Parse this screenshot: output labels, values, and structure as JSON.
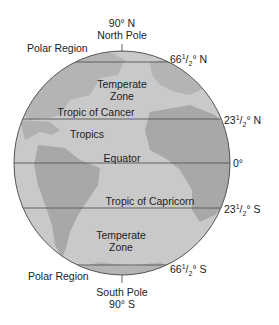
{
  "diagram": {
    "colors": {
      "ocean": "#c9c9c9",
      "land": "#a9a9a9",
      "outline": "#555555",
      "text": "#222222"
    },
    "top": {
      "latitude": "90° N",
      "pole": "North Pole"
    },
    "bottom": {
      "pole": "South Pole",
      "latitude": "90° S"
    },
    "regions": {
      "polar_north": "Polar Region",
      "temperate_north_1": "Temperate",
      "temperate_north_2": "Zone",
      "tropics": "Tropics",
      "temperate_south_1": "Temperate",
      "temperate_south_2": "Zone",
      "polar_south": "Polar Region"
    },
    "lines": {
      "tropic_cancer": "Tropic of Cancer",
      "equator": "Equator",
      "tropic_capricorn": "Tropic of Capricorn"
    },
    "latitudes": {
      "arctic": {
        "whole": "66",
        "frac_num": "1",
        "frac_den": "2",
        "suffix": "° N"
      },
      "cancer": {
        "whole": "23",
        "frac_num": "1",
        "frac_den": "2",
        "suffix": "° N"
      },
      "equator": "0°",
      "capricorn": {
        "whole": "23",
        "frac_num": "1",
        "frac_den": "2",
        "suffix": "° S"
      },
      "antarctic": {
        "whole": "66",
        "frac_num": "1",
        "frac_den": "2",
        "suffix": "° S"
      }
    }
  }
}
